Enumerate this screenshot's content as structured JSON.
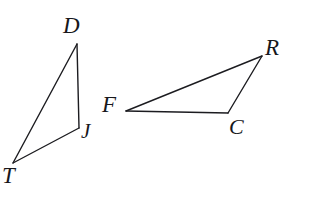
{
  "canvas": {
    "width": 314,
    "height": 197,
    "background_color": "#ffffff",
    "stroke_color": "#1c1c20",
    "label_color": "#17171b"
  },
  "figure": {
    "kind": "two-triangles"
  },
  "shapes": [
    {
      "name": "triangle-DJT",
      "vertex_order": "D-J-T",
      "stroke_width": 1.4,
      "points": [
        {
          "label": "D",
          "x": 77,
          "y": 44
        },
        {
          "label": "J",
          "x": 79,
          "y": 128
        },
        {
          "label": "T",
          "x": 13,
          "y": 163
        }
      ],
      "edges": [
        {
          "name": "edge-DJ",
          "from": "D",
          "to": "J"
        },
        {
          "name": "edge-JT",
          "from": "J",
          "to": "T"
        },
        {
          "name": "edge-TD",
          "from": "T",
          "to": "D"
        }
      ]
    },
    {
      "name": "triangle-FRC",
      "vertex_order": "F-R-C",
      "stroke_width": 1.4,
      "points": [
        {
          "label": "F",
          "x": 126,
          "y": 111
        },
        {
          "label": "R",
          "x": 262,
          "y": 56
        },
        {
          "label": "C",
          "x": 228,
          "y": 113
        }
      ],
      "edges": [
        {
          "name": "edge-FR",
          "from": "F",
          "to": "R"
        },
        {
          "name": "edge-RC",
          "from": "R",
          "to": "C"
        },
        {
          "name": "edge-CF",
          "from": "C",
          "to": "F"
        }
      ]
    }
  ],
  "labels": [
    {
      "key": "D",
      "text": "D",
      "x": 63,
      "y": 14,
      "font_size": 23
    },
    {
      "key": "T",
      "text": "T",
      "x": 2,
      "y": 164,
      "font_size": 23
    },
    {
      "key": "J",
      "text": "J",
      "x": 81,
      "y": 121,
      "font_size": 21
    },
    {
      "key": "F",
      "text": "F",
      "x": 102,
      "y": 93,
      "font_size": 23
    },
    {
      "key": "R",
      "text": "R",
      "x": 265,
      "y": 36,
      "font_size": 23
    },
    {
      "key": "C",
      "text": "C",
      "x": 229,
      "y": 116,
      "font_size": 22
    }
  ],
  "watermark": {
    "text": "",
    "x": 215,
    "y": 176
  }
}
